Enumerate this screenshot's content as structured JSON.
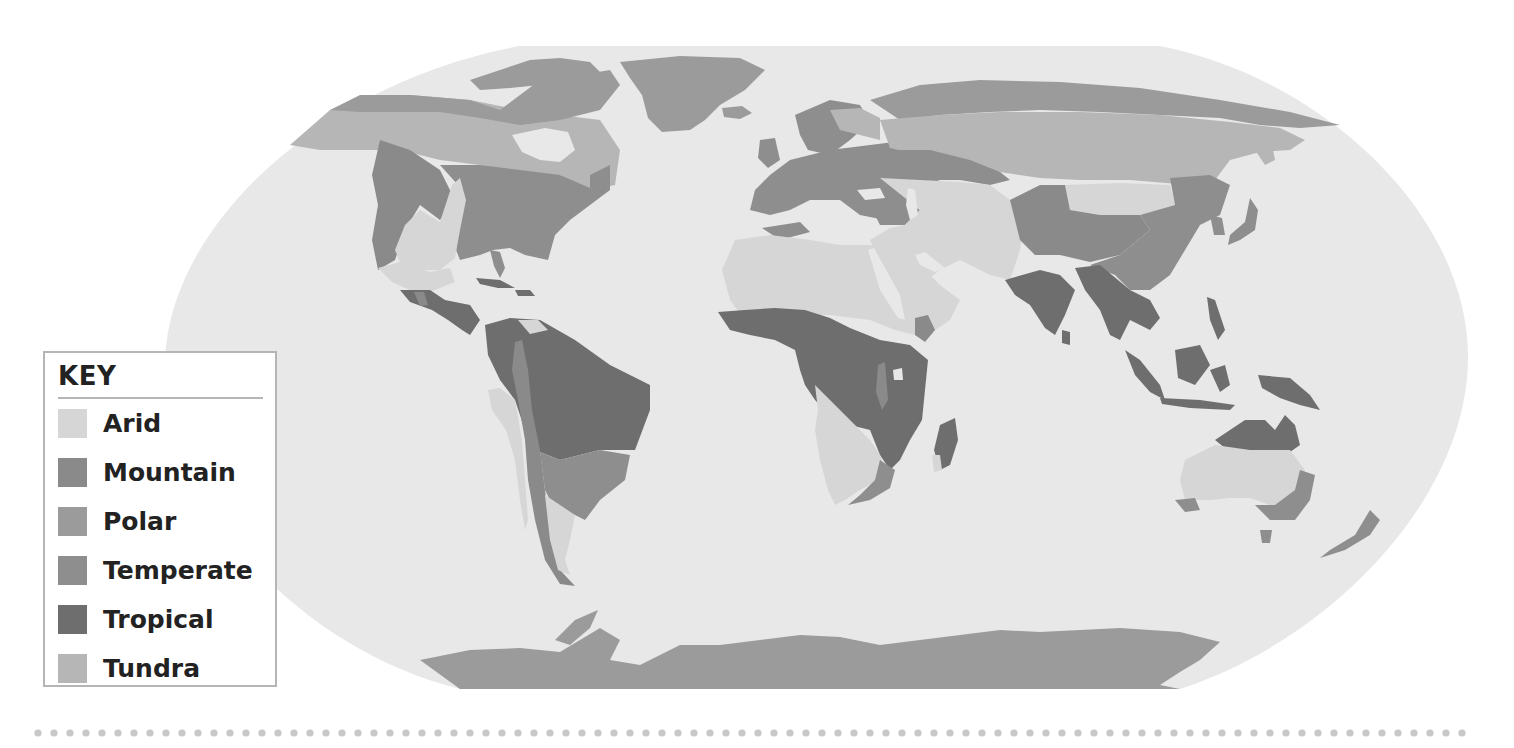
{
  "map": {
    "title": "World Climate Regions",
    "ocean_color": "#e8e8e8",
    "regions": {
      "arid": "#d6d6d6",
      "mountain": "#8a8a8a",
      "polar": "#9b9b9b",
      "temperate": "#8e8e8e",
      "tropical": "#6e6e6e",
      "tundra": "#b6b6b6"
    }
  },
  "key": {
    "title": "KEY",
    "items": [
      {
        "label": "Arid",
        "color": "#d6d6d6"
      },
      {
        "label": "Mountain",
        "color": "#8a8a8a"
      },
      {
        "label": "Polar",
        "color": "#9b9b9b"
      },
      {
        "label": "Temperate",
        "color": "#8e8e8e"
      },
      {
        "label": "Tropical",
        "color": "#6e6e6e"
      },
      {
        "label": "Tundra",
        "color": "#b6b6b6"
      }
    ]
  },
  "divider": {
    "style": "dotted",
    "color": "#c8c8c8"
  }
}
